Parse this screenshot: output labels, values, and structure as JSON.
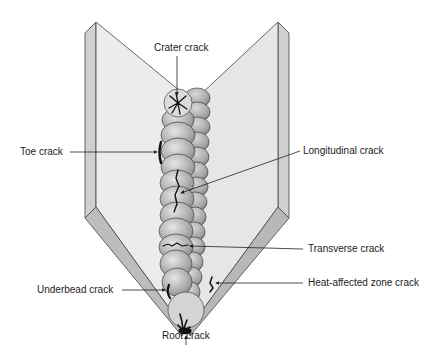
{
  "diagram": {
    "colors": {
      "plate_face": "#e9e9e9",
      "plate_edge": "#c9c9c9",
      "bevel": "#bdbdbd",
      "bead": "#b5b5b5",
      "outline": "#333333",
      "crack": "#111111"
    },
    "labels": {
      "crater": "Crater crack",
      "toe": "Toe crack",
      "longitudinal": "Longitudinal crack",
      "transverse": "Transverse crack",
      "underbead": "Underbead crack",
      "haz": "Heat-affected zone crack",
      "root": "Root crack"
    }
  }
}
